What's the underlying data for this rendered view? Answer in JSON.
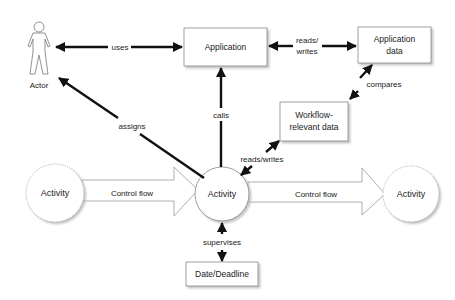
{
  "diagram": {
    "nodes": {
      "actor": {
        "label": "Actor",
        "shape": "stick-figure"
      },
      "application": {
        "label": "Application",
        "shape": "box"
      },
      "application_data": {
        "line1": "Application",
        "line2": "data",
        "shape": "box"
      },
      "workflow_data": {
        "line1": "Workflow-",
        "line2": "relevant data",
        "shape": "box"
      },
      "activity_left": {
        "label": "Activity",
        "shape": "dashed-circle"
      },
      "activity_center": {
        "label": "Activity",
        "shape": "circle"
      },
      "activity_right": {
        "label": "Activity",
        "shape": "dashed-circle"
      },
      "date_deadline": {
        "label": "Date/Deadline",
        "shape": "box"
      }
    },
    "edges": {
      "uses": {
        "label": "uses",
        "from": "actor",
        "to": "application",
        "direction": "both"
      },
      "reads_writes_app": {
        "line1": "reads/",
        "line2": "writes",
        "from": "application",
        "to": "application_data",
        "direction": "both"
      },
      "calls": {
        "label": "calls",
        "from": "activity_center",
        "to": "application",
        "direction": "forward"
      },
      "assigns": {
        "label": "assigns",
        "from": "activity_center",
        "to": "actor",
        "direction": "forward"
      },
      "compares": {
        "label": "compares",
        "from": "workflow_data",
        "to": "application_data",
        "direction": "both"
      },
      "reads_writes_wf": {
        "label": "reads/writes",
        "from": "activity_center",
        "to": "workflow_data",
        "direction": "both"
      },
      "control_flow_left": {
        "label": "Control flow",
        "from": "activity_left",
        "to": "activity_center",
        "style": "hollow-block-arrow"
      },
      "control_flow_right": {
        "label": "Control flow",
        "from": "activity_center",
        "to": "activity_right",
        "style": "hollow-block-arrow"
      },
      "supervises": {
        "label": "supervises",
        "from": "activity_center",
        "to": "date_deadline",
        "direction": "both"
      }
    },
    "colors": {
      "line": "#111111",
      "box_border": "#888888",
      "shadow": "#cfcfcf",
      "text": "#222222"
    }
  }
}
